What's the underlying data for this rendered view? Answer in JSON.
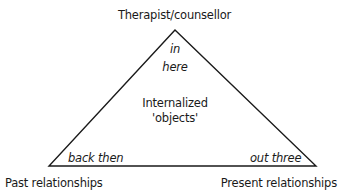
{
  "diagram": {
    "type": "triangle",
    "vertices": {
      "top": "Therapist/counsellor",
      "bottom_left": "Past relationships",
      "bottom_right": "Present relationships"
    },
    "corner_labels": {
      "top": [
        "in",
        "here"
      ],
      "bottom_left": "back then",
      "bottom_right": "out three"
    },
    "center": [
      "Internalized",
      "'objects'"
    ],
    "colors": {
      "line": "#1a1a1a",
      "text": "#1a1a1a",
      "background": "#ffffff"
    }
  }
}
